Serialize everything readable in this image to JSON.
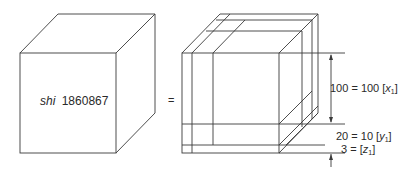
{
  "diagram": {
    "left_cube": {
      "label_italic": "shi",
      "label_number": "1860867"
    },
    "equals_sign": "=",
    "right_cube": {
      "annotations": [
        {
          "text_main": "100 = 100 [",
          "var": "x",
          "sub": "1",
          "close": "]"
        },
        {
          "text_main": "20 = 10 [",
          "var": "y",
          "sub": "1",
          "close": "]"
        },
        {
          "text_main": "3 = [",
          "var": "z",
          "sub": "1",
          "close": "]"
        }
      ]
    }
  }
}
